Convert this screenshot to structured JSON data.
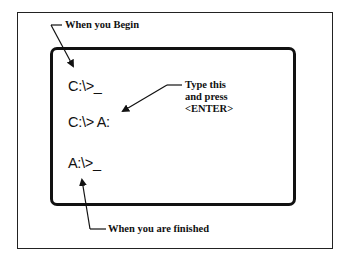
{
  "labels": {
    "begin": "When you Begin",
    "finished": "When you are finished",
    "instruction": [
      "Type this",
      "and press",
      "<ENTER>"
    ]
  },
  "prompts": {
    "start": "C:\\>_",
    "command": "C:\\> A:",
    "end": "A:\\>_"
  },
  "colors": {
    "ink": "#111111",
    "background": "#ffffff"
  }
}
